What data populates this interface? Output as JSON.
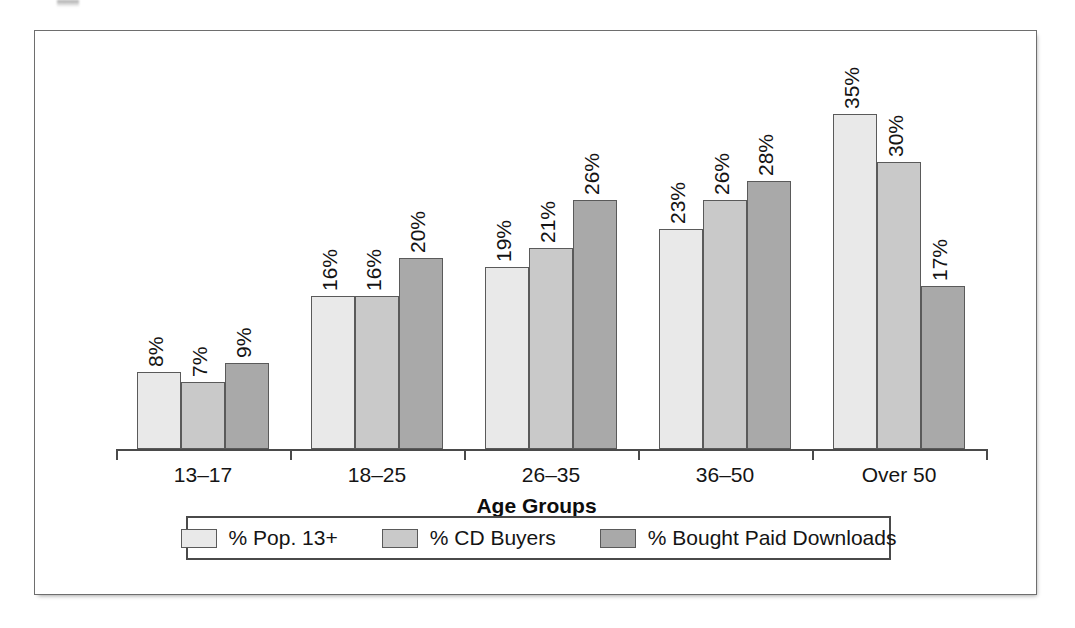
{
  "chart_data": {
    "type": "bar",
    "title": "",
    "subtitle": "",
    "xlabel": "Age Groups",
    "ylabel": "",
    "ylim": [
      0,
      38
    ],
    "grid": false,
    "legend_position": "bottom",
    "value_suffix": "%",
    "categories": [
      "13–17",
      "18–25",
      "26–35",
      "36–50",
      "Over 50"
    ],
    "series": [
      {
        "name": "% Pop. 13+",
        "color": "#e9e9e9",
        "values": [
          8,
          16,
          19,
          23,
          35
        ],
        "labels": [
          "8%",
          "16%",
          "19%",
          "23%",
          "35%"
        ]
      },
      {
        "name": "% CD Buyers",
        "color": "#c9c9c9",
        "values": [
          7,
          16,
          21,
          26,
          30
        ],
        "labels": [
          "7%",
          "16%",
          "21%",
          "26%",
          "30%"
        ]
      },
      {
        "name": "% Bought Paid Downloads",
        "color": "#a9a9a9",
        "values": [
          9,
          20,
          26,
          28,
          17
        ],
        "labels": [
          "9%",
          "20%",
          "26%",
          "28%",
          "17%"
        ]
      }
    ]
  },
  "axis": {
    "x_title": "Age Groups",
    "tick_labels": [
      "13–17",
      "18–25",
      "26–35",
      "36–50",
      "Over 50"
    ]
  },
  "legend": {
    "items": [
      {
        "label": "% Pop. 13+",
        "color": "#e9e9e9"
      },
      {
        "label": "% CD Buyers",
        "color": "#c9c9c9"
      },
      {
        "label": "% Bought Paid Downloads",
        "color": "#a9a9a9"
      }
    ]
  },
  "style": {
    "series_colors": [
      "#e9e9e9",
      "#c9c9c9",
      "#a9a9a9"
    ],
    "bar_outline": "#5a5a5a",
    "axis_color": "#4a4a4a",
    "text_color": "#141414",
    "frame_color": "#6e6e6e",
    "background": "#ffffff"
  }
}
